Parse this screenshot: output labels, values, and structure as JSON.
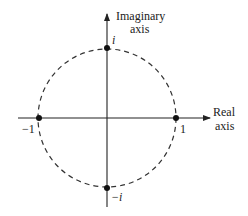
{
  "diagram": {
    "axes": {
      "imaginary_label_line1": "Imaginary",
      "imaginary_label_line2": "axis",
      "real_label_line1": "Real",
      "real_label_line2": "axis"
    },
    "points": [
      {
        "name": "i",
        "label": "i",
        "re": 0,
        "im": 1
      },
      {
        "name": "minus-i",
        "label": "−i",
        "re": 0,
        "im": -1
      },
      {
        "name": "one",
        "label": "1",
        "re": 1,
        "im": 0
      },
      {
        "name": "minus-one",
        "label": "−1",
        "re": -1,
        "im": 0
      }
    ],
    "circle": {
      "radius": 1,
      "style": "dashed"
    },
    "colors": {
      "line": "#222222",
      "background": "#ffffff"
    }
  }
}
